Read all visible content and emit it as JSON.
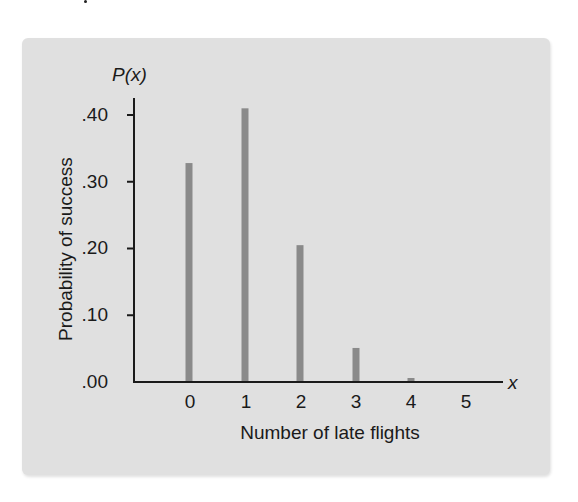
{
  "chart_data": {
    "type": "bar",
    "title": "",
    "xlabel": "Number of late flights",
    "ylabel": "Probability of success",
    "y_axis_symbol": "P(x)",
    "x_axis_symbol": "x",
    "categories": [
      "0",
      "1",
      "2",
      "3",
      "4",
      "5"
    ],
    "values": [
      0.328,
      0.41,
      0.205,
      0.051,
      0.006,
      0.0
    ],
    "ylim": [
      0,
      0.4
    ],
    "yticks": [
      ".00",
      ".10",
      ".20",
      ".30",
      ".40"
    ],
    "grid": false,
    "legend": null,
    "bar_color": "#8a8a8a",
    "background_color": "#e0e0e0"
  }
}
